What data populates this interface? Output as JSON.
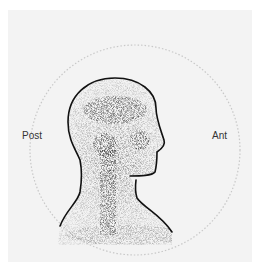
{
  "figure": {
    "labels": {
      "left": "Post",
      "right": "Ant"
    },
    "colors": {
      "background": "#f3f3f3",
      "border": "#ffffff",
      "outline": "#111111",
      "uptake": "#222222",
      "field_of_view_ring": "#bdbdbd"
    }
  }
}
